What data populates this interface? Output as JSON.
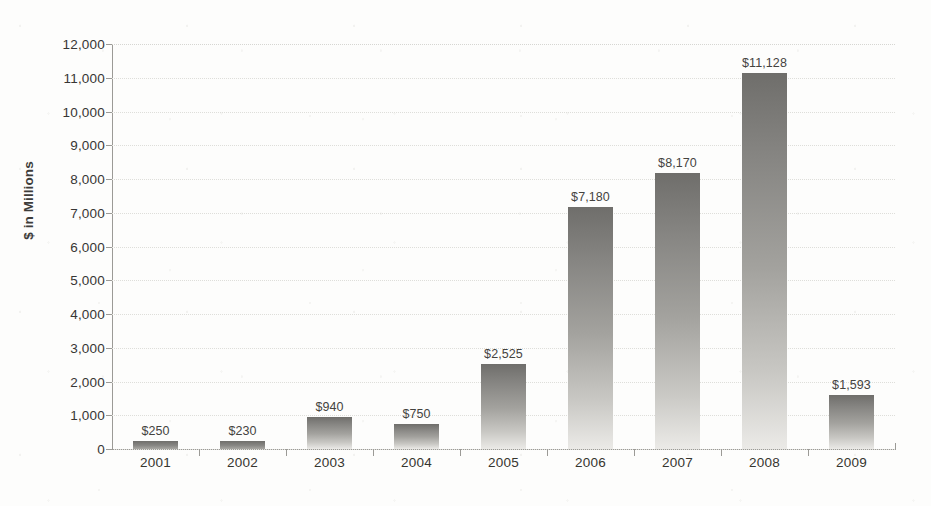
{
  "chart_data": {
    "type": "bar",
    "title": "",
    "xlabel": "",
    "ylabel": "$ in Millions",
    "categories": [
      "2001",
      "2002",
      "2003",
      "2004",
      "2005",
      "2006",
      "2007",
      "2008",
      "2009"
    ],
    "values": [
      250,
      230,
      940,
      750,
      2525,
      7180,
      8170,
      11128,
      1593
    ],
    "value_labels": [
      "$250",
      "$230",
      "$940",
      "$750",
      "$2,525",
      "$7,180",
      "$8,170",
      "$11,128",
      "$1,593"
    ],
    "ylim": [
      0,
      12000
    ],
    "ytick_values": [
      0,
      1000,
      2000,
      3000,
      4000,
      5000,
      6000,
      7000,
      8000,
      9000,
      10000,
      11000,
      12000
    ],
    "ytick_labels": [
      "0",
      "1,000",
      "2,000",
      "3,000",
      "4,000",
      "5,000",
      "6,000",
      "7,000",
      "8,000",
      "9,000",
      "10,000",
      "11,000",
      "12,000"
    ],
    "grid": true,
    "grid_axis": "y",
    "legend": false,
    "legend_position": "none",
    "bar_color": "#8a8985",
    "bar_gradient": [
      "#6f6e6b",
      "#ebeae7"
    ],
    "gridline_color": "#dededa",
    "axis_color": "#9b9a96",
    "text_color": "#373634",
    "background_color": "#fdfdfc",
    "units": "$ in Millions"
  }
}
